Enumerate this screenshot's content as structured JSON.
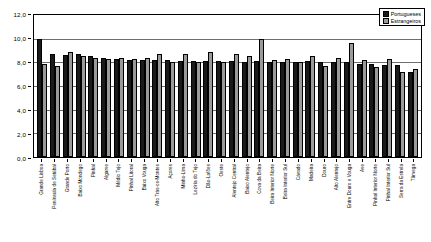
{
  "chart_data": {
    "type": "bar",
    "title": "",
    "subtitle": "",
    "xlabel": "",
    "ylabel": "",
    "ylim": [
      0.0,
      12.0
    ],
    "ytick_step": 2.0,
    "ytick_labels": [
      "12,0",
      "10,0",
      "8,0",
      "6,0",
      "4,0",
      "2,0",
      "0,0"
    ],
    "ytick_values": [
      12.0,
      10.0,
      8.0,
      6.0,
      4.0,
      2.0,
      0.0
    ],
    "grid": true,
    "grid_axis": "y",
    "legend_position": "top-right",
    "orientation": "vertical",
    "categories": [
      "Grande Lisboa",
      "Península de Setúbal",
      "Grande Porto",
      "Baixo Mondego",
      "Pinhal",
      "Algarve",
      "Médio Tejo",
      "Pinhal Litoral",
      "Baixo Vouga",
      "Alto Trás-os-Montes",
      "Açores",
      "Minho-Lima",
      "Lezíria do Tejo",
      "Dão-Lafões",
      "Oeste",
      "Alentejo Central",
      "Baixo Alentejo",
      "Cova da Beira",
      "Beira Interior Norte",
      "Beira Interior Sul",
      "Cávado",
      "Madeira",
      "Douro",
      "Alto Alentejo",
      "Entre Douro e Vouga",
      "Ave",
      "Pinhal Interior Norte",
      "Pinhal Interior Sul",
      "Serra da Estrela",
      "Tâmega"
    ],
    "series": [
      {
        "name": "Portugueses",
        "color": "#1a1a1a",
        "values": [
          10.0,
          8.7,
          8.6,
          8.7,
          8.5,
          8.4,
          8.3,
          8.2,
          8.2,
          8.2,
          8.2,
          8.1,
          8.1,
          8.1,
          8.1,
          8.1,
          8.0,
          8.1,
          8.0,
          8.0,
          8.0,
          8.1,
          8.0,
          8.0,
          8.0,
          7.9,
          7.9,
          7.8,
          7.8,
          7.2
        ]
      },
      {
        "name": "Estrangeiros",
        "color": "#9a9a9a",
        "values": [
          7.9,
          7.7,
          8.9,
          8.5,
          8.4,
          8.3,
          8.4,
          8.3,
          8.4,
          8.7,
          8.0,
          8.7,
          8.0,
          8.9,
          8.0,
          8.7,
          8.5,
          10.0,
          8.2,
          8.3,
          8.0,
          8.5,
          7.7,
          8.4,
          9.6,
          8.2,
          7.6,
          8.3,
          7.2,
          7.4
        ]
      }
    ]
  },
  "legend": {
    "entries": [
      {
        "label": "Portugueses",
        "swatch": "series-pt"
      },
      {
        "label": "Estrangeiros",
        "swatch": "series-es"
      }
    ]
  }
}
